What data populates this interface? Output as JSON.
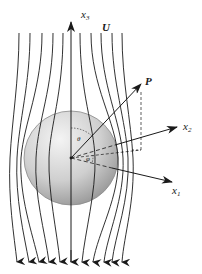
{
  "figure": {
    "type": "flow-around-sphere",
    "labels": {
      "x3": "x",
      "x3_sub": "3",
      "x2": "x",
      "x2_sub": "2",
      "x1": "x",
      "x1_sub": "1",
      "U": "U",
      "P": "P",
      "theta": "θ",
      "phi": "φ"
    },
    "colors": {
      "line": "#1a1a1a",
      "sphere_light": "#f2f2f2",
      "sphere_dark": "#9a9a9a",
      "sphere_edge": "#8a8a8a",
      "background": "#ffffff"
    },
    "sphere": {
      "cx": 71,
      "cy": 158,
      "r": 47
    },
    "streamline_count": 11,
    "flow_direction": "downward"
  }
}
